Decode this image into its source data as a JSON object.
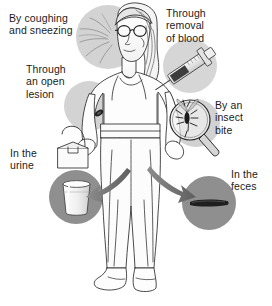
{
  "figure": {
    "background_color": "#ffffff",
    "ink_color": "#1b1b1b",
    "circle_light_color": "#cdcdcd",
    "circle_dark_color": "#8a8a8a",
    "arrow_color": "#6f6f6f",
    "highlight_dark": "#2a2a2a"
  },
  "labels": {
    "coughing": "By coughing\nand sneezing",
    "lesion": "Through\nan open\nlesion",
    "blood": "Through\nremoval\nof blood",
    "insect": "By an\ninsect\nbite",
    "urine": "In the\nurine",
    "feces": "In the\nfeces"
  },
  "icons": {
    "sneeze": "sneeze-spray-icon",
    "lesion": "skin-lesion-icon",
    "syringe": "syringe-icon",
    "mosquito": "mosquito-magnifier-icon",
    "urine_cup": "urine-specimen-cup-icon",
    "feces": "feces-smear-icon",
    "arrow_left": "arrow-pointing-left-icon",
    "arrow_right": "arrow-pointing-right-icon"
  }
}
